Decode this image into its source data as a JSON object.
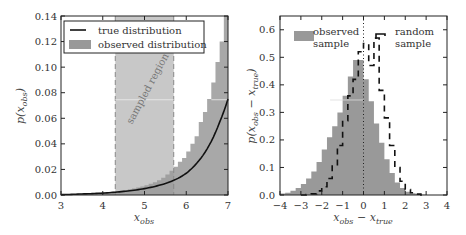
{
  "chart_data": [
    {
      "type": "line+histogram",
      "panel": "left",
      "title": "",
      "xlabel": "x_obs",
      "ylabel": "p(x_obs)",
      "xlim": [
        3,
        7
      ],
      "ylim": [
        0,
        0.14
      ],
      "xticks": [
        3,
        4,
        5,
        6,
        7
      ],
      "yticks": [
        0.0,
        0.02,
        0.04,
        0.06,
        0.08,
        0.1,
        0.12,
        0.14
      ],
      "ytick_labels": [
        "0.00",
        "0.02",
        "0.04",
        "0.06",
        "0.08",
        "0.10",
        "0.12",
        "0.14"
      ],
      "grid": false,
      "legend": {
        "position": "upper left",
        "entries": [
          {
            "label": "true distribution",
            "style": "line",
            "color": "#111111"
          },
          {
            "label": "observed distribution",
            "style": "patch",
            "color": "#999999"
          }
        ]
      },
      "annotations": [
        {
          "text": "sampled region",
          "x_range": [
            4.3,
            5.7
          ],
          "rotation": -60,
          "fill": "#cccccc"
        }
      ],
      "series": [
        {
          "name": "true distribution",
          "kind": "line",
          "color": "#111111",
          "x": [
            3.0,
            3.5,
            4.0,
            4.5,
            5.0,
            5.5,
            5.8,
            6.0,
            6.2,
            6.4,
            6.6,
            6.8,
            7.0
          ],
          "y": [
            0.0003,
            0.0008,
            0.0015,
            0.0028,
            0.005,
            0.009,
            0.013,
            0.017,
            0.023,
            0.031,
            0.042,
            0.057,
            0.075
          ]
        },
        {
          "name": "observed distribution",
          "kind": "histogram",
          "color": "#999999",
          "bin_edges": [
            3.0,
            3.1,
            3.2,
            3.3,
            3.4,
            3.5,
            3.6,
            3.7,
            3.8,
            3.9,
            4.0,
            4.1,
            4.2,
            4.3,
            4.4,
            4.5,
            4.6,
            4.7,
            4.8,
            4.9,
            5.0,
            5.1,
            5.2,
            5.3,
            5.4,
            5.5,
            5.6,
            5.7,
            5.8,
            5.9,
            6.0,
            6.1,
            6.2,
            6.3,
            6.4,
            6.5,
            6.6,
            6.7,
            6.8,
            6.9,
            7.0
          ],
          "values": [
            0.0005,
            0.0006,
            0.0007,
            0.0008,
            0.0009,
            0.001,
            0.0011,
            0.0013,
            0.0015,
            0.0017,
            0.0019,
            0.0022,
            0.0025,
            0.0029,
            0.0033,
            0.0038,
            0.0044,
            0.005,
            0.0058,
            0.0066,
            0.0076,
            0.0088,
            0.01,
            0.0115,
            0.0135,
            0.016,
            0.019,
            0.022,
            0.026,
            0.029,
            0.034,
            0.04,
            0.046,
            0.057,
            0.065,
            0.075,
            0.088,
            0.104,
            0.12,
            0.14
          ]
        }
      ]
    },
    {
      "type": "histogram",
      "panel": "right",
      "title": "",
      "xlabel": "x_obs − x_true",
      "ylabel": "p(x_obs − x_true)",
      "xlim": [
        -4,
        4
      ],
      "ylim": [
        0,
        0.65
      ],
      "xticks": [
        -4,
        -3,
        -2,
        -1,
        0,
        1,
        2,
        3,
        4
      ],
      "xtick_labels": [
        "−4",
        "−3",
        "−2",
        "−1",
        "0",
        "1",
        "2",
        "3",
        "4"
      ],
      "yticks": [
        0.0,
        0.1,
        0.2,
        0.3,
        0.4,
        0.5,
        0.6
      ],
      "ytick_labels": [
        "0.0",
        "0.1",
        "0.2",
        "0.3",
        "0.4",
        "0.5",
        "0.6"
      ],
      "grid": false,
      "vline": {
        "x": 0,
        "style": "dotted",
        "color": "#222222"
      },
      "legend": {
        "entries": [
          {
            "label_line1": "observed",
            "label_line2": "sample",
            "style": "patch",
            "color": "#999999",
            "position": "upper left"
          },
          {
            "label_line1": "random",
            "label_line2": "sample",
            "style": "dashed-step",
            "color": "#111111",
            "position": "upper right"
          }
        ]
      },
      "series": [
        {
          "name": "observed sample",
          "kind": "histogram",
          "color": "#999999",
          "bin_edges": [
            -4.0,
            -3.75,
            -3.5,
            -3.25,
            -3.0,
            -2.75,
            -2.5,
            -2.25,
            -2.0,
            -1.75,
            -1.5,
            -1.25,
            -1.0,
            -0.75,
            -0.5,
            -0.25,
            0.0,
            0.25,
            0.5,
            0.75,
            1.0,
            1.25,
            1.5,
            1.75,
            2.0,
            2.25,
            2.5,
            2.75,
            3.0
          ],
          "values": [
            0.005,
            0.008,
            0.015,
            0.025,
            0.04,
            0.06,
            0.085,
            0.12,
            0.165,
            0.21,
            0.25,
            0.3,
            0.36,
            0.43,
            0.49,
            0.49,
            0.42,
            0.34,
            0.26,
            0.19,
            0.13,
            0.08,
            0.045,
            0.025,
            0.012,
            0.006,
            0.003,
            0.001
          ]
        },
        {
          "name": "random sample",
          "kind": "histogram-step",
          "style": "dashed",
          "color": "#111111",
          "bin_edges": [
            -3.0,
            -2.75,
            -2.5,
            -2.25,
            -2.0,
            -1.75,
            -1.5,
            -1.25,
            -1.0,
            -0.75,
            -0.5,
            -0.25,
            0.0,
            0.25,
            0.5,
            0.75,
            1.0,
            1.25,
            1.5,
            1.75,
            2.0,
            2.25,
            2.5,
            2.75,
            3.0
          ],
          "values": [
            0.0,
            0.002,
            0.004,
            0.015,
            0.03,
            0.06,
            0.11,
            0.18,
            0.27,
            0.36,
            0.42,
            0.52,
            0.55,
            0.47,
            0.57,
            0.38,
            0.28,
            0.18,
            0.1,
            0.05,
            0.02,
            0.008,
            0.003,
            0.0
          ]
        }
      ]
    }
  ],
  "labels": {
    "left_legend_1": "true distribution",
    "left_legend_2": "observed distribution",
    "sampled_region": "sampled region",
    "right_legend_observed_1": "observed",
    "right_legend_observed_2": "sample",
    "right_legend_random_1": "random",
    "right_legend_random_2": "sample"
  },
  "colors": {
    "hist_fill": "#999999",
    "region_fill": "#c8c8c8",
    "axis": "#222222",
    "line": "#111111",
    "region_edge": "#888888"
  }
}
